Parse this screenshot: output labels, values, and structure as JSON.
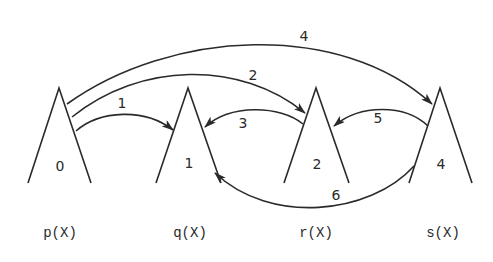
{
  "diagram": {
    "nodes": [
      {
        "id": "p",
        "label": "p(X)",
        "value": "0"
      },
      {
        "id": "q",
        "label": "q(X)",
        "value": "1"
      },
      {
        "id": "r",
        "label": "r(X)",
        "value": "2"
      },
      {
        "id": "s",
        "label": "s(X)",
        "value": "4"
      }
    ],
    "edges": [
      {
        "label": "1",
        "from": "p",
        "to": "q"
      },
      {
        "label": "2",
        "from": "p",
        "to": "r"
      },
      {
        "label": "3",
        "from": "r",
        "to": "q"
      },
      {
        "label": "4",
        "from": "p",
        "to": "s"
      },
      {
        "label": "5",
        "from": "s",
        "to": "r"
      },
      {
        "label": "6",
        "from": "s",
        "to": "q"
      }
    ]
  }
}
